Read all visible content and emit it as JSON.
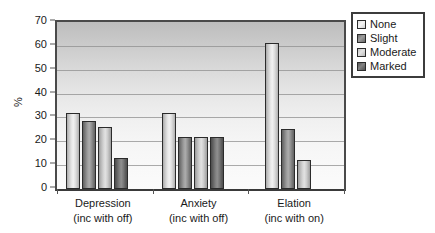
{
  "chart_data": {
    "type": "bar",
    "title": "",
    "subtitle": "",
    "xlabel": "",
    "ylabel": "%",
    "ylim": [
      0,
      70
    ],
    "ytick_step": 10,
    "yticks": [
      0,
      10,
      20,
      30,
      40,
      50,
      60,
      70
    ],
    "grid": true,
    "grid_axis": "y",
    "legend_position": "right-outside",
    "categories": [
      "Depression",
      "Anxiety",
      "Elation"
    ],
    "category_sublabels": [
      "(inc with off)",
      "(inc with off)",
      "(inc with on)"
    ],
    "series": [
      {
        "name": "None",
        "values": [
          32,
          32,
          61
        ]
      },
      {
        "name": "Slight",
        "values": [
          28.5,
          22,
          25
        ]
      },
      {
        "name": "Moderate",
        "values": [
          26,
          22,
          12
        ]
      },
      {
        "name": "Marked",
        "values": [
          13,
          22,
          null
        ]
      }
    ]
  },
  "axes": {
    "y_label": "%",
    "y_tick_labels": [
      "70",
      "60",
      "50",
      "40",
      "30",
      "20",
      "10",
      "0"
    ],
    "x_groups": [
      {
        "label": "Depression",
        "sublabel": "(inc with off)"
      },
      {
        "label": "Anxiety",
        "sublabel": "(inc with off)"
      },
      {
        "label": "Elation",
        "sublabel": "(inc with on)"
      }
    ]
  },
  "legend": {
    "items": [
      {
        "label": "None",
        "swatch": "none-swatch",
        "color": "#e9e9e9"
      },
      {
        "label": "Slight",
        "swatch": "slight-swatch",
        "color": "#8a8a8a"
      },
      {
        "label": "Moderate",
        "swatch": "moderate-swatch",
        "color": "#d5d5d5"
      },
      {
        "label": "Marked",
        "swatch": "marked-swatch",
        "color": "#6f6f6f"
      }
    ]
  },
  "colors": {
    "plot_background_top": "#bdbdbd",
    "plot_background_bottom": "#fbfbfb",
    "axis_line": "#4a4a4a",
    "gridline": "#8f8f8f",
    "bar_outline": "#2b2b2b",
    "text": "#1a1a1a",
    "page_background": "#ffffff"
  }
}
